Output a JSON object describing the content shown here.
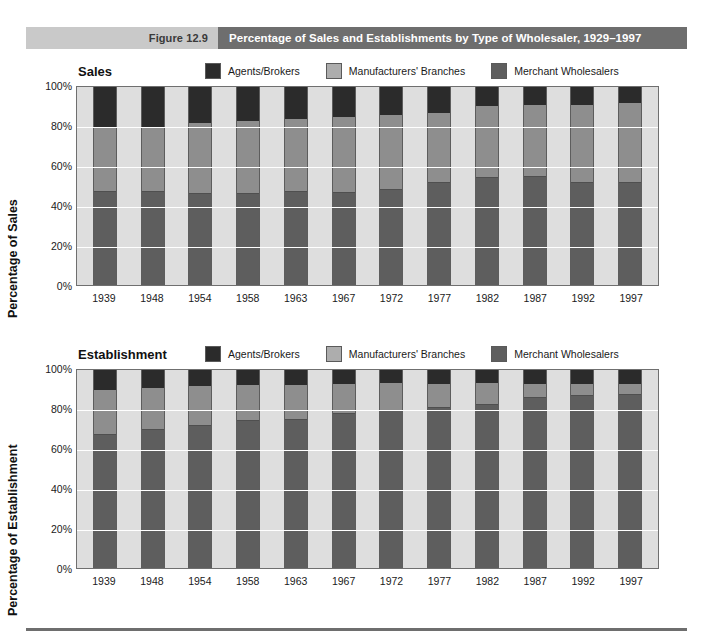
{
  "header": {
    "figure_number": "Figure 12.9",
    "figure_title": "Percentage of Sales and Establishments by Type of Wholesaler, 1929–1997"
  },
  "colors": {
    "agents": "#2b2b2b",
    "branches": "#8e8e8e",
    "merchant": "#5e5e5e",
    "plot_background": "#dedede",
    "banner_tab": "#c9c9c9",
    "banner_title": "#6e6e6e"
  },
  "legend": {
    "items": [
      {
        "label": "Agents/Brokers",
        "swatch": "#2b2b2b",
        "icon": "legend-swatch-icon"
      },
      {
        "label": "Manufacturers' Branches",
        "swatch": "#8e8e8e",
        "icon": "legend-swatch-icon"
      },
      {
        "label": "Merchant Wholesalers",
        "swatch": "#5e5e5e",
        "icon": "legend-swatch-icon"
      }
    ]
  },
  "charts": {
    "sales": {
      "name": "Sales",
      "ylabel": "Percentage of Sales",
      "yticks": [
        "100%",
        "80%",
        "60%",
        "40%",
        "20%",
        "0%"
      ]
    },
    "establishment": {
      "name": "Establishment",
      "ylabel": "Percentage of Establishment",
      "yticks": [
        "100%",
        "80%",
        "60%",
        "40%",
        "20%",
        "0%"
      ]
    }
  },
  "chart_data": [
    {
      "type": "bar",
      "subtype": "stacked-100-percent",
      "title": "Sales",
      "xlabel": "",
      "ylabel": "Percentage of Sales",
      "ylim": [
        0,
        100
      ],
      "yticks": [
        0,
        20,
        40,
        60,
        80,
        100
      ],
      "ytick_labels": [
        "0%",
        "20%",
        "40%",
        "60%",
        "80%",
        "100%"
      ],
      "grid": true,
      "legend_position": "top",
      "categories": [
        "1939",
        "1948",
        "1954",
        "1958",
        "1963",
        "1967",
        "1972",
        "1977",
        "1982",
        "1987",
        "1992",
        "1997"
      ],
      "series": [
        {
          "name": "Merchant Wholesalers",
          "color": "#5e5e5e",
          "values": [
            47,
            47,
            46,
            46,
            47,
            46.5,
            48,
            51.5,
            54,
            54.5,
            51.5,
            51.5
          ]
        },
        {
          "name": "Manufacturers' Branches",
          "color": "#8e8e8e",
          "values": [
            33,
            33,
            36,
            37,
            37,
            38.5,
            38,
            35.5,
            36.5,
            36.5,
            39.5,
            40.5
          ]
        },
        {
          "name": "Agents/Brokers",
          "color": "#2b2b2b",
          "values": [
            20,
            20,
            18,
            17,
            16,
            15,
            14,
            13,
            9.5,
            9,
            9,
            8
          ]
        }
      ]
    },
    {
      "type": "bar",
      "subtype": "stacked-100-percent",
      "title": "Establishment",
      "xlabel": "",
      "ylabel": "Percentage of Establishment",
      "ylim": [
        0,
        100
      ],
      "yticks": [
        0,
        20,
        40,
        60,
        80,
        100
      ],
      "ytick_labels": [
        "0%",
        "20%",
        "40%",
        "60%",
        "80%",
        "100%"
      ],
      "grid": true,
      "legend_position": "top",
      "categories": [
        "1939",
        "1948",
        "1954",
        "1958",
        "1963",
        "1967",
        "1972",
        "1977",
        "1982",
        "1987",
        "1992",
        "1997"
      ],
      "series": [
        {
          "name": "Merchant Wholesalers",
          "color": "#5e5e5e",
          "values": [
            67,
            69.5,
            71.5,
            74,
            75,
            78,
            79.5,
            81,
            82.5,
            86,
            87,
            87.5
          ]
        },
        {
          "name": "Manufacturers' Branches",
          "color": "#8e8e8e",
          "values": [
            23,
            21.5,
            20.5,
            18.5,
            17.5,
            15,
            14,
            12,
            11,
            7,
            6,
            5.5
          ]
        },
        {
          "name": "Agents/Brokers",
          "color": "#2b2b2b",
          "values": [
            10,
            9,
            8,
            7.5,
            7.5,
            7,
            6.5,
            7,
            6.5,
            7,
            7,
            7
          ]
        }
      ]
    }
  ]
}
